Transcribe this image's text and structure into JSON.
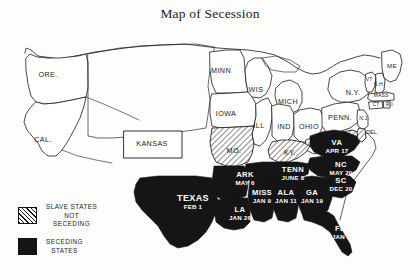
{
  "title": "Map of Secession",
  "colors": {
    "seceding_fill": "#151515",
    "slave_not_seceding_fill": "#ffffff",
    "hatch_stroke": "#1a1a1a",
    "outline": "#1a1a1a",
    "paper": "#fdfdfb",
    "seceding_label": "#ffffff"
  },
  "legend": {
    "items": [
      {
        "swatch": "hatch-swatch",
        "lines": [
          "SLAVE STATES",
          "NOT",
          "SECEDING"
        ]
      },
      {
        "swatch": "solid-swatch",
        "lines": [
          "SECEDING",
          "STATES"
        ]
      }
    ]
  },
  "map": {
    "free_states": [
      {
        "name": "ORE.",
        "x": 48,
        "y": 75
      },
      {
        "name": "CAL.",
        "x": 43,
        "y": 140
      },
      {
        "name": "MINN",
        "x": 221,
        "y": 71
      },
      {
        "name": "WIS",
        "x": 256,
        "y": 90
      },
      {
        "name": "IOWA",
        "x": 226,
        "y": 114
      },
      {
        "name": "ILL",
        "x": 259,
        "y": 126
      },
      {
        "name": "MICH",
        "x": 288,
        "y": 102
      },
      {
        "name": "IND",
        "x": 284,
        "y": 127
      },
      {
        "name": "OHIO",
        "x": 309,
        "y": 127
      },
      {
        "name": "PENN.",
        "x": 340,
        "y": 118
      },
      {
        "name": "N.Y.",
        "x": 353,
        "y": 93
      },
      {
        "name": "ME",
        "x": 392,
        "y": 66
      },
      {
        "name": "VT",
        "x": 369,
        "y": 80
      },
      {
        "name": "N.H.",
        "x": 378,
        "y": 85
      },
      {
        "name": "MASS",
        "x": 381,
        "y": 96
      },
      {
        "name": "CT",
        "x": 376,
        "y": 105
      },
      {
        "name": "R.I.",
        "x": 389,
        "y": 105
      },
      {
        "name": "N.J.",
        "x": 364,
        "y": 119
      },
      {
        "name": "W.VA",
        "x": 315,
        "y": 145
      },
      {
        "name": "KANSAS",
        "x": 152,
        "y": 144
      }
    ],
    "slave_not_seceding": [
      {
        "name": "MO.",
        "x": 234,
        "y": 151
      },
      {
        "name": "KY.",
        "x": 290,
        "y": 153
      },
      {
        "name": "DEL.",
        "x": 371,
        "y": 133
      }
    ],
    "seceding_states": [
      {
        "name": "VA",
        "date": "APR 17",
        "x": 337,
        "y": 146
      },
      {
        "name": "NC",
        "date": "MAY 20",
        "x": 341,
        "y": 168
      },
      {
        "name": "SC",
        "date": "DEC 20",
        "x": 341,
        "y": 184
      },
      {
        "name": "GA",
        "date": "JAN 19",
        "x": 312,
        "y": 196
      },
      {
        "name": "ALA",
        "date": "JAN 11",
        "x": 286,
        "y": 196
      },
      {
        "name": "MISS",
        "date": "JAN 9",
        "x": 262,
        "y": 196
      },
      {
        "name": "TENN",
        "date": "JUNE 8",
        "x": 293,
        "y": 173
      },
      {
        "name": "ARK",
        "date": "MAY 6",
        "x": 245,
        "y": 178
      },
      {
        "name": "LA",
        "date": "JAN 26",
        "x": 240,
        "y": 213
      },
      {
        "name": "TEXAS",
        "date": "FEB 1",
        "x": 193,
        "y": 202
      },
      {
        "name": "FLA",
        "date": "JAN 10",
        "x": 343,
        "y": 232
      }
    ]
  }
}
